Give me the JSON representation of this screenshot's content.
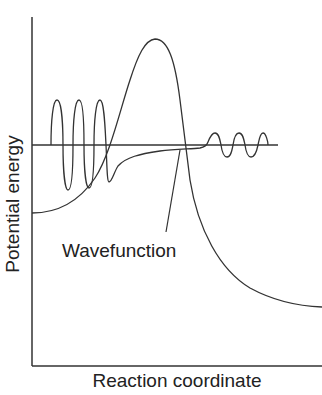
{
  "diagram": {
    "title": "",
    "axes": {
      "y_label": "Potential energy",
      "x_label": "Reaction coordinate"
    },
    "annotations": {
      "wavefunction_label": "Wavefunction"
    },
    "elements": [
      {
        "name": "potential-energy-barrier-curve",
        "description": "Potential energy curve rising from a left well to a barrier peak and falling to a lower product plateau"
      },
      {
        "name": "energy-level-line",
        "description": "Horizontal line marking the particle energy, below the barrier top"
      },
      {
        "name": "wavefunction-curve",
        "description": "Oscillating wavefunction on the left, decaying inside the barrier, emerging with smaller amplitude oscillations on the right (tunnelling)"
      },
      {
        "name": "wavefunction-pointer",
        "description": "Leader line from the label to the wavefunction inside the barrier"
      }
    ],
    "colors": {
      "line": "#333333",
      "background": "#ffffff",
      "text": "#222222"
    }
  }
}
